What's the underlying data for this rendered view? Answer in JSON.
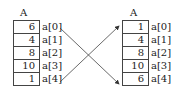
{
  "left_array": {
    "title": "A",
    "values": [
      "6",
      "4",
      "8",
      "10",
      "1"
    ],
    "labels": [
      "a[0]",
      "a[1]",
      "a[2]",
      "a[3]",
      "a[4]"
    ]
  },
  "right_array": {
    "title": "A",
    "values": [
      "1",
      "4",
      "8",
      "10",
      "6"
    ],
    "labels": [
      "a[0]",
      "a[1]",
      "a[2]",
      "a[3]",
      "a[4]"
    ]
  },
  "arrows": [
    {
      "from": "a[0]",
      "to": "a[4]"
    },
    {
      "from": "a[4]",
      "to": "a[0]"
    }
  ],
  "colors": {
    "line": "#444444",
    "text": "#222222"
  }
}
